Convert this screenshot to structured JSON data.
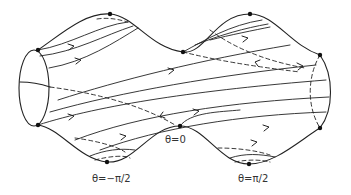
{
  "figure": {
    "labels": {
      "theta_zero": "θ=0",
      "theta_minus_half_pi": "θ=−π/2",
      "theta_half_pi": "θ=π/2"
    },
    "colors": {
      "line": "#222222",
      "background": "#ffffff"
    }
  }
}
